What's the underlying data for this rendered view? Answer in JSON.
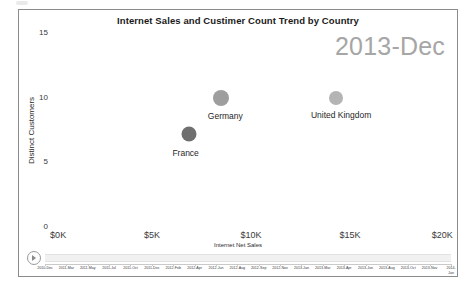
{
  "chart_data": {
    "type": "scatter",
    "title": "Internet Sales and Custimer Count Trend by Country",
    "xlabel": "Internet Net Sales",
    "ylabel": "Distinct Customers",
    "xlim": [
      0,
      20000
    ],
    "ylim": [
      0,
      15
    ],
    "xtick_labels": [
      "$0K",
      "$5K",
      "$10K",
      "$15K",
      "$20K"
    ],
    "xtick_values": [
      0,
      5000,
      10000,
      15000,
      20000
    ],
    "ytick_labels": [
      "0",
      "5",
      "10",
      "15"
    ],
    "ytick_values": [
      0,
      5,
      10,
      15
    ],
    "grid": false,
    "legend": "none",
    "annotation": "2013-Dec",
    "points": [
      {
        "label": "Germany",
        "x": 8500,
        "y": 9.9,
        "size": 16,
        "color": "#9e9e9e",
        "label_dx": 4,
        "label_dy": 13
      },
      {
        "label": "United Kingdom",
        "x": 14300,
        "y": 9.9,
        "size": 14,
        "color": "#b4b4b4",
        "label_dx": 5,
        "label_dy": 12
      },
      {
        "label": "France",
        "x": 6850,
        "y": 7.1,
        "size": 15,
        "color": "#6f6f6f",
        "label_dx": -3,
        "label_dy": 14
      }
    ]
  },
  "play_axis": {
    "play_button_label": "Play",
    "periods": [
      "2010-Dec",
      "2011-Mar",
      "2011-May",
      "2011-Jul",
      "2011-Oct",
      "2011-Dec",
      "2012-Feb",
      "2012-Apr",
      "2012-Jun",
      "2012-Aug",
      "2012-Sep",
      "2012-Nov",
      "2013-Jan",
      "2013-Mar",
      "2013-Apr",
      "2013-Jun",
      "2013-Aug",
      "2013-Oct",
      "2013-Nov",
      "2014-Jan"
    ],
    "selected_period": "2013-Dec"
  },
  "colors": {
    "frame_border": "#8b8b8b",
    "title_text": "#1a1a1a",
    "watermark": "#a6a6a6",
    "axis_text": "#3a3a3a",
    "track": "#f1f1f1"
  }
}
